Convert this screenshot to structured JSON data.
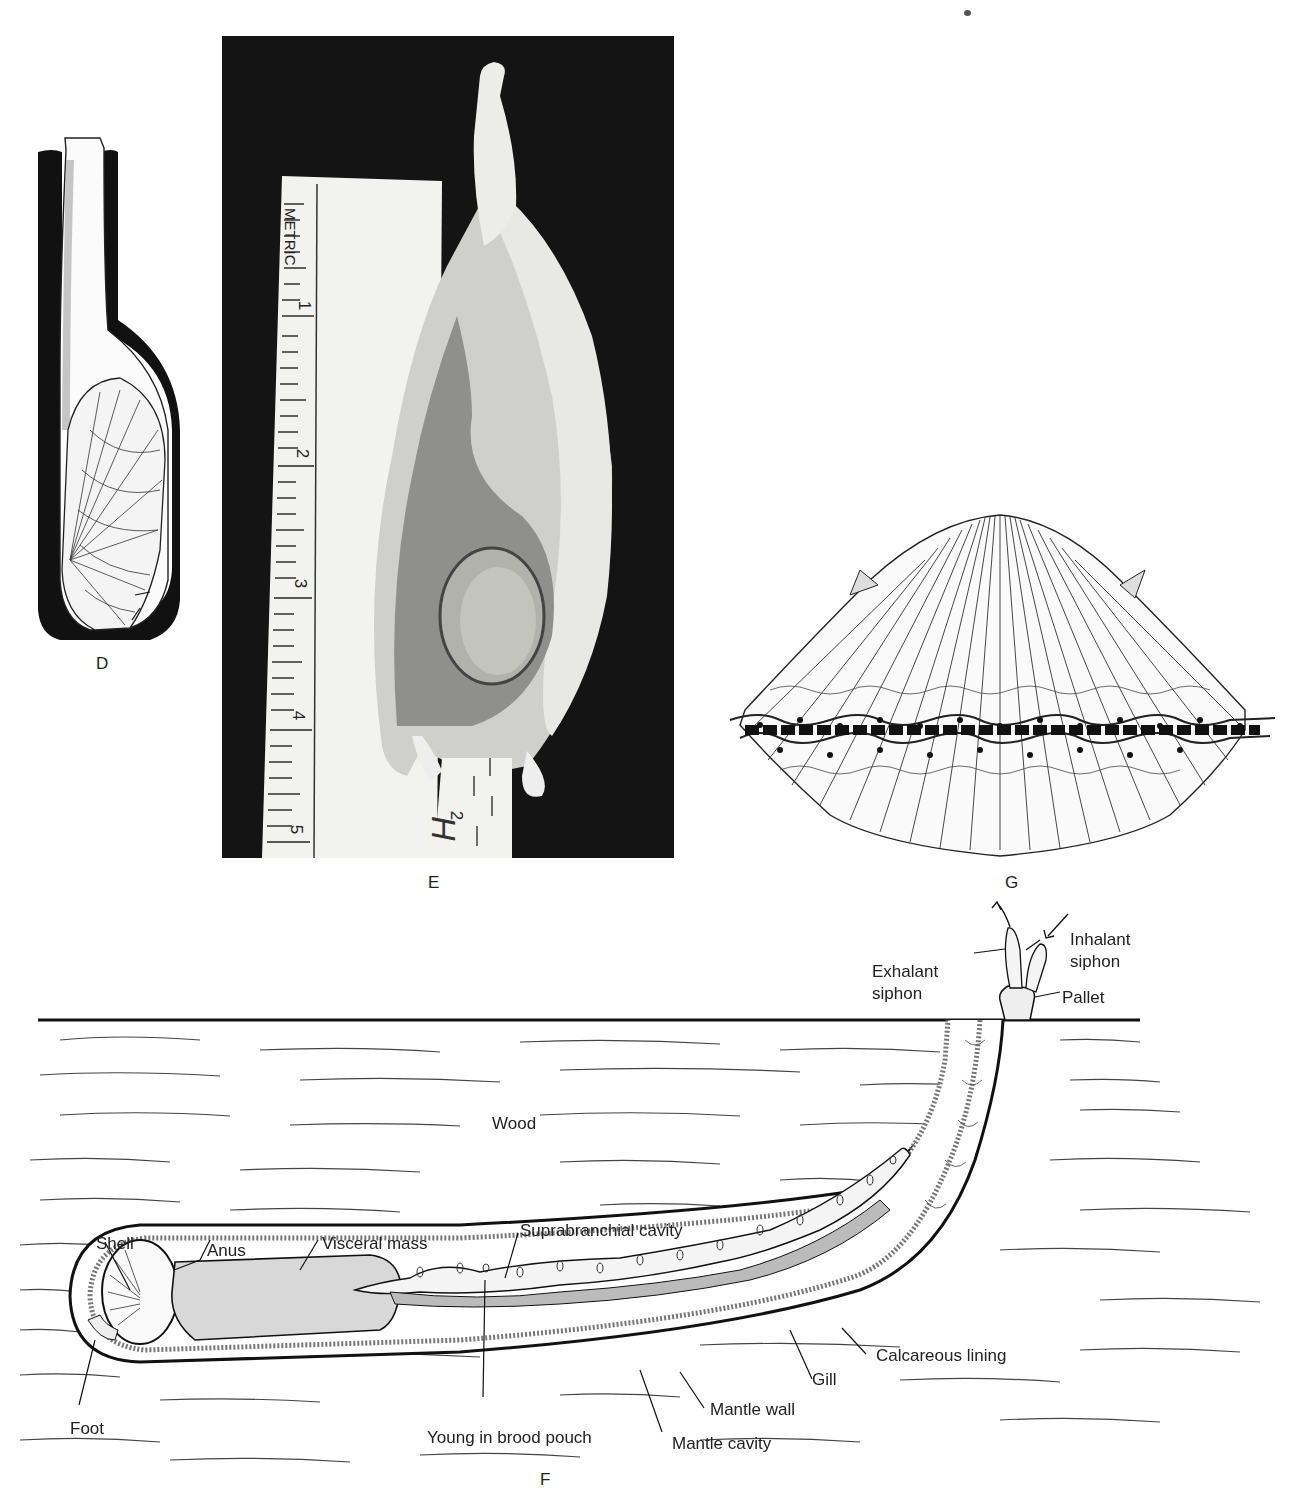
{
  "figure": {
    "panels": [
      {
        "id": "D",
        "label": "D",
        "description": "Shipworm shell within calcareous-lined burrow"
      },
      {
        "id": "E",
        "label": "E",
        "description": "Photograph of shell beside metric ruler"
      },
      {
        "id": "G",
        "label": "G",
        "description": "Scallop shell with mantle eyes along gape"
      },
      {
        "id": "F",
        "label": "F",
        "description": "Shipworm in wood burrow, anatomical cross-section"
      }
    ],
    "ruler": {
      "heading": "METRIC",
      "cm_marks": [
        "1",
        "2",
        "3",
        "4",
        "5"
      ],
      "secondary_mark": "2"
    },
    "panel_f": {
      "substrate_label": "Wood",
      "labels": {
        "exhalant_siphon": "Exhalant\nsiphon",
        "exhalant_line1": "Exhalant",
        "exhalant_line2": "siphon",
        "inhalant_line1": "Inhalant",
        "inhalant_line2": "siphon",
        "pallet": "Pallet",
        "shell": "Shell",
        "anus": "Anus",
        "visceral_mass": "Visceral mass",
        "suprabranchial_cavity": "Suprabranchial cavity",
        "calcareous_lining": "Calcareous lining",
        "gill": "Gill",
        "mantle_wall": "Mantle wall",
        "mantle_cavity": "Mantle cavity",
        "young_in_brood_pouch": "Young in brood pouch",
        "foot": "Foot"
      }
    },
    "colors": {
      "ink": "#1a1a1a",
      "photo_background": "#141414",
      "ruler": "#f2f2ee",
      "paper": "#ffffff"
    }
  }
}
